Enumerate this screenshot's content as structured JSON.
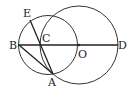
{
  "diagram": {
    "type": "geometry",
    "stroke_color": "#333333",
    "background": "#ffffff",
    "points": {
      "A": {
        "label": "A",
        "x": 53,
        "y": 74
      },
      "B": {
        "label": "B",
        "x": 19,
        "y": 45
      },
      "C": {
        "label": "C",
        "x": 41,
        "y": 45
      },
      "D": {
        "label": "D",
        "x": 118,
        "y": 45
      },
      "E": {
        "label": "E",
        "x": 30,
        "y": 20
      },
      "O": {
        "label": "O",
        "x": 79,
        "y": 45
      }
    },
    "circles": [
      {
        "name": "circle-O",
        "center": "O",
        "cx": 79,
        "cy": 45,
        "r": 39
      },
      {
        "name": "circle-small",
        "cx": 48,
        "cy": 45,
        "r": 29.5,
        "through": [
          "B",
          "E",
          "A"
        ]
      }
    ],
    "segments": [
      [
        "B",
        "D"
      ],
      [
        "E",
        "A"
      ],
      [
        "B",
        "A"
      ]
    ]
  }
}
